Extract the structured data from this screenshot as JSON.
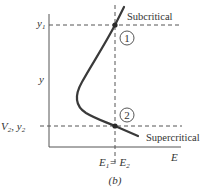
{
  "diagram": {
    "caption": "(b)",
    "axes": {
      "x_label": "E",
      "y_label": "y"
    },
    "levels": {
      "y1_label": "y",
      "y1_sub": "1",
      "y2_label": "V",
      "y2_sub": "2",
      "y2_sep": ", y",
      "y2_sub2": "2"
    },
    "energy_label": {
      "e1": "E",
      "e1_sub": "1",
      "eq": "= E",
      "e2_sub": "2"
    },
    "branches": {
      "upper": "Subcritical",
      "lower": "Supercritical"
    },
    "points": [
      {
        "id": "1",
        "label": "1"
      },
      {
        "id": "2",
        "label": "2"
      }
    ],
    "colors": {
      "curve": "#3a3a3a",
      "axis": "#555555",
      "dashed": "#555555",
      "text": "#333333"
    }
  }
}
